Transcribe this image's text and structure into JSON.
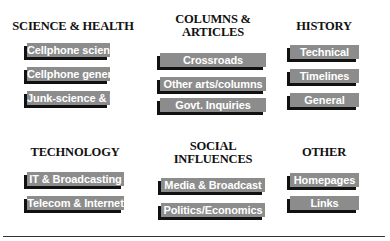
{
  "sections": [
    {
      "title": "SCIENCE & HEALTH",
      "links": [
        "Cellphone science",
        "Cellphone general",
        "Junk-science & PR"
      ]
    },
    {
      "title": "COLUMNS & ARTICLES",
      "title_lines": [
        "COLUMNS &",
        "ARTICLES"
      ],
      "links": [
        "Crossroads",
        "Other arts/columns",
        "Govt. Inquiries"
      ]
    },
    {
      "title": "HISTORY",
      "links": [
        "Technical",
        "Timelines",
        "General"
      ]
    },
    {
      "title": "TECHNOLOGY",
      "links": [
        "IT & Broadcasting",
        "Telecom & Internet"
      ]
    },
    {
      "title": "SOCIAL INFLUENCES",
      "title_lines": [
        "SOCIAL",
        "INFLUENCES"
      ],
      "links": [
        "Media & Broadcast",
        "Politics/Economics"
      ]
    },
    {
      "title": "OTHER",
      "links": [
        "Homepages",
        "Links"
      ]
    }
  ],
  "colors": {
    "button_bg": "#8c8c8c",
    "button_text": "#ffffff",
    "button_shadow": "#111111",
    "heading_text": "#111111",
    "background": "#ffffff"
  }
}
